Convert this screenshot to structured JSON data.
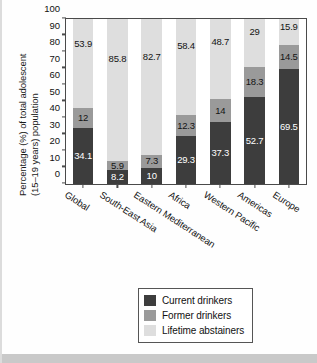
{
  "chart_data": {
    "type": "bar",
    "subtype": "stacked-100-percent",
    "title": "",
    "xlabel": "",
    "ylabel": "Percentage (%) of total adolescent (15–19 years) population",
    "ylabel_lines": [
      "Percentage (%) of total adolescent",
      "(15–19 years) population"
    ],
    "ylim": [
      0,
      100
    ],
    "yticks": [
      0,
      10,
      20,
      30,
      40,
      50,
      60,
      70,
      80,
      90,
      100
    ],
    "ytick_labels": [
      "0",
      "10",
      "20",
      "30",
      "40",
      "50",
      "60",
      "70",
      "80",
      "90",
      "100"
    ],
    "grid": false,
    "legend_position": "bottom-center-right",
    "categories": [
      "Global",
      "South-East Asia",
      "Eastern Mediterranean",
      "Africa",
      "Western Pacific",
      "Americas",
      "Europe"
    ],
    "series": [
      {
        "name": "Current drinkers",
        "color": "#3d3d3d",
        "values": [
          34.1,
          8.2,
          10,
          29.3,
          37.3,
          52.7,
          69.5
        ],
        "value_labels": [
          "34.1",
          "8.2",
          "10",
          "29.3",
          "37.3",
          "52.7",
          "69.5"
        ]
      },
      {
        "name": "Former drinkers",
        "color": "#9a9a9a",
        "values": [
          12,
          5.9,
          7.3,
          12.3,
          14,
          18.3,
          14.5
        ],
        "value_labels": [
          "12",
          "5.9",
          "7.3",
          "12.3",
          "14",
          "18.3",
          "14.5"
        ]
      },
      {
        "name": "Lifetime abstainers",
        "color": "#dedede",
        "values": [
          53.9,
          85.8,
          82.7,
          58.4,
          48.7,
          29,
          15.9
        ],
        "value_labels": [
          "53.9",
          "85.8",
          "82.7",
          "58.4",
          "48.7",
          "29",
          "15.9"
        ]
      }
    ]
  },
  "legend": {
    "items": [
      {
        "label": "Current drinkers",
        "color": "#3d3d3d"
      },
      {
        "label": "Former drinkers",
        "color": "#9a9a9a"
      },
      {
        "label": "Lifetime abstainers",
        "color": "#dedede"
      }
    ]
  }
}
